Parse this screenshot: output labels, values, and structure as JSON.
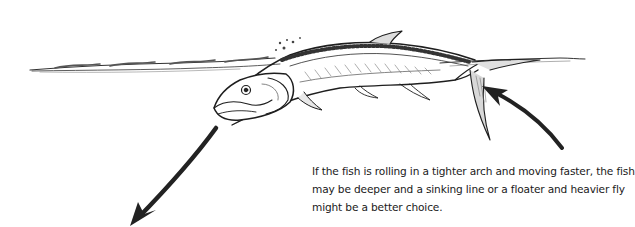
{
  "figure": {
    "elements": {
      "water_surface": "water-surface-line",
      "fish": "tarpon-fish",
      "entry_arrow": "arrow-into-water",
      "exit_arrow": "arrow-out-of-water"
    },
    "colors": {
      "ink": "#1e1e1e",
      "background": "#ffffff",
      "text": "#1a1a1a"
    }
  },
  "caption": {
    "lines": [
      "If the fish is rolling in a tighter arch and moving faster, the fish",
      "may be deeper and a sinking line or a floater and heavier fly",
      "might be a better choice."
    ]
  }
}
